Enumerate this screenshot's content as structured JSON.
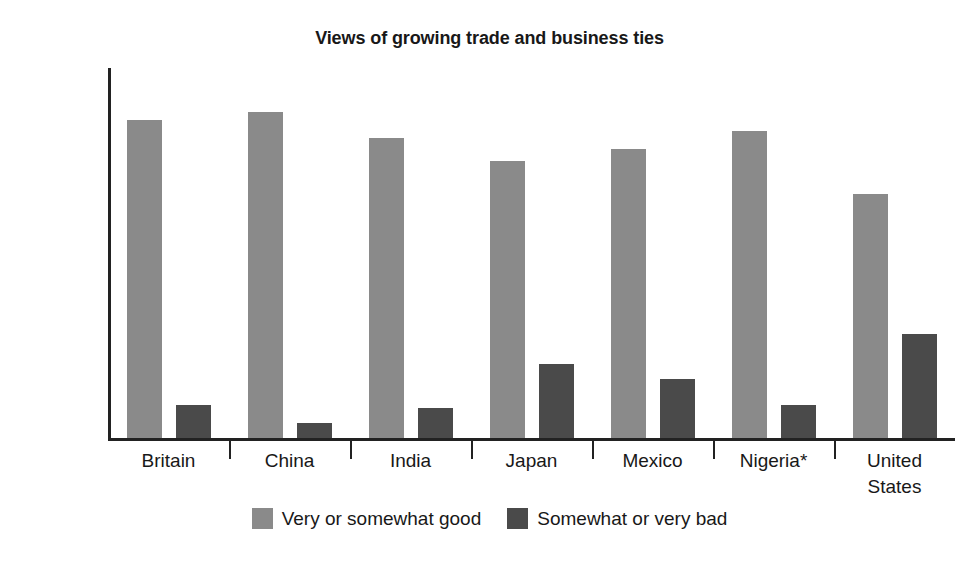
{
  "chart_data": {
    "type": "bar",
    "title": "Views of growing trade and business ties",
    "xlabel": "",
    "ylabel": "Percentage",
    "ylim": [
      0,
      100
    ],
    "ytick_step": 10,
    "yticks": [
      100,
      90,
      80,
      70,
      60,
      50,
      40,
      30,
      20,
      10,
      0
    ],
    "grid": false,
    "legend_position": "bottom-center",
    "categories": [
      "Britain",
      "China",
      "India",
      "Japan",
      "Mexico",
      "Nigeria*",
      "United\nStates"
    ],
    "series": [
      {
        "name": "Very or somewhat good",
        "color": "#8a8a8a",
        "values": [
          86,
          88,
          81,
          75,
          78,
          83,
          66
        ]
      },
      {
        "name": "Somewhat or very bad",
        "color": "#4a4a4a",
        "values": [
          9,
          4,
          8,
          20,
          16,
          9,
          28
        ]
      }
    ],
    "annotations": []
  },
  "chart": {
    "title": "Views of growing trade and business ties",
    "y_axis_label": "Percentage"
  }
}
